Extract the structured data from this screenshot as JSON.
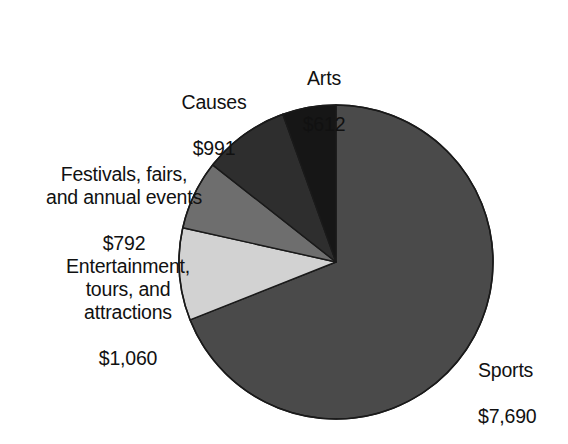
{
  "chart_data": {
    "type": "pie",
    "title": "",
    "subtitle": "",
    "xlabel": "",
    "ylabel": "",
    "grid": false,
    "legend_position": "none",
    "value_prefix": "$",
    "total": 11145,
    "categories": [
      "Sports",
      "Entertainment, tours, and attractions",
      "Festivals, fairs, and annual events",
      "Causes",
      "Arts"
    ],
    "values": [
      7690,
      1060,
      792,
      991,
      612
    ],
    "slices": [
      {
        "name": "Sports",
        "label_lines": "Sports",
        "value": 7690,
        "value_text": "$7,690",
        "percent": 69.0,
        "start_angle": 0.0,
        "sweep_angle": 248.4,
        "color": "#4a4a4a",
        "label_position": "right"
      },
      {
        "name": "Entertainment, tours, and attractions",
        "label_lines": "Entertainment,\ntours, and\nattractions",
        "value": 1060,
        "value_text": "$1,060",
        "percent": 9.5,
        "start_angle": 248.4,
        "sweep_angle": 34.2,
        "color": "#d2d2d2",
        "label_position": "left"
      },
      {
        "name": "Festivals, fairs, and annual events",
        "label_lines": "Festivals, fairs,\nand annual events",
        "value": 792,
        "value_text": "$792",
        "percent": 7.1,
        "start_angle": 282.6,
        "sweep_angle": 25.6,
        "color": "#6e6e6e",
        "label_position": "left"
      },
      {
        "name": "Causes",
        "label_lines": "Causes",
        "value": 991,
        "value_text": "$991",
        "percent": 8.9,
        "start_angle": 308.2,
        "sweep_angle": 32.0,
        "color": "#2e2e2e",
        "label_position": "top-left"
      },
      {
        "name": "Arts",
        "label_lines": "Arts",
        "value": 612,
        "value_text": "$612",
        "percent": 5.5,
        "start_angle": 340.2,
        "sweep_angle": 19.8,
        "color": "#161616",
        "label_position": "top"
      }
    ],
    "geometry": {
      "center_x": 336,
      "center_y": 262,
      "radius": 157
    },
    "stroke_color": "#1a1a1a",
    "background": "#ffffff"
  },
  "labels": {
    "arts": {
      "name": "Arts",
      "value": "$612"
    },
    "causes": {
      "name": "Causes",
      "value": "$991"
    },
    "festivals": {
      "name": "Festivals, fairs,\nand annual events",
      "value": "$792"
    },
    "entertainment": {
      "name": "Entertainment,\ntours, and\nattractions",
      "value": "$1,060"
    },
    "sports": {
      "name": "Sports",
      "value": "$7,690"
    }
  }
}
